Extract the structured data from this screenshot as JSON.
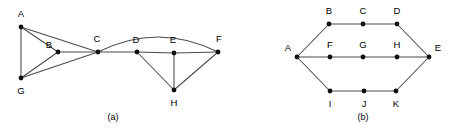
{
  "figure": {
    "background_color": "#ffffff",
    "edge_color": "#4a4a4a",
    "node_color": "#111111",
    "label_color": "#000000",
    "width": 449,
    "height": 133
  },
  "panels": [
    {
      "id": "panel-a",
      "caption": "(a)",
      "caption_pos": {
        "x": 113,
        "y": 118
      },
      "nodes": [
        {
          "id": "A",
          "label": "A",
          "x": 21,
          "y": 27,
          "lx": 21,
          "ly": 14
        },
        {
          "id": "B",
          "label": "B",
          "x": 58,
          "y": 52,
          "lx": 49,
          "ly": 45
        },
        {
          "id": "C",
          "label": "C",
          "x": 98,
          "y": 52,
          "lx": 97,
          "ly": 39
        },
        {
          "id": "D",
          "label": "D",
          "x": 137,
          "y": 52,
          "lx": 136,
          "ly": 40
        },
        {
          "id": "E",
          "label": "E",
          "x": 174,
          "y": 53,
          "lx": 173,
          "ly": 40
        },
        {
          "id": "F",
          "label": "F",
          "x": 218,
          "y": 52,
          "lx": 219,
          "ly": 39
        },
        {
          "id": "G",
          "label": "G",
          "x": 21,
          "y": 78,
          "lx": 21,
          "ly": 91
        },
        {
          "id": "H",
          "label": "H",
          "x": 174,
          "y": 90,
          "lx": 174,
          "ly": 103
        }
      ],
      "edges": [
        {
          "from": "A",
          "to": "G",
          "type": "line"
        },
        {
          "from": "A",
          "to": "B",
          "type": "line"
        },
        {
          "from": "A",
          "to": "C",
          "type": "line"
        },
        {
          "from": "B",
          "to": "C",
          "type": "line"
        },
        {
          "from": "B",
          "to": "G",
          "type": "line"
        },
        {
          "from": "G",
          "to": "C",
          "type": "line"
        },
        {
          "from": "C",
          "to": "D",
          "type": "line"
        },
        {
          "from": "D",
          "to": "E",
          "type": "line"
        },
        {
          "from": "E",
          "to": "F",
          "type": "line"
        },
        {
          "from": "D",
          "to": "H",
          "type": "line"
        },
        {
          "from": "E",
          "to": "H",
          "type": "line"
        },
        {
          "from": "F",
          "to": "H",
          "type": "line"
        },
        {
          "from": "C",
          "to": "F",
          "type": "curve",
          "cx": 158,
          "cy": 22
        }
      ]
    },
    {
      "id": "panel-b",
      "caption": "(b)",
      "caption_pos": {
        "x": 363,
        "y": 118
      },
      "nodes": [
        {
          "id": "A",
          "label": "A",
          "x": 297,
          "y": 57,
          "lx": 288,
          "ly": 48
        },
        {
          "id": "B",
          "label": "B",
          "x": 329,
          "y": 24,
          "lx": 329,
          "ly": 11
        },
        {
          "id": "C",
          "label": "C",
          "x": 363,
          "y": 24,
          "lx": 363,
          "ly": 11
        },
        {
          "id": "D",
          "label": "D",
          "x": 397,
          "y": 24,
          "lx": 397,
          "ly": 11
        },
        {
          "id": "E",
          "label": "E",
          "x": 429,
          "y": 57,
          "lx": 438,
          "ly": 48
        },
        {
          "id": "F",
          "label": "F",
          "x": 330,
          "y": 57,
          "lx": 330,
          "ly": 45
        },
        {
          "id": "G",
          "label": "G",
          "x": 363,
          "y": 57,
          "lx": 363,
          "ly": 45
        },
        {
          "id": "H",
          "label": "H",
          "x": 397,
          "y": 57,
          "lx": 397,
          "ly": 45
        },
        {
          "id": "I",
          "label": "I",
          "x": 330,
          "y": 91,
          "lx": 330,
          "ly": 104
        },
        {
          "id": "J",
          "label": "J",
          "x": 364,
          "y": 91,
          "lx": 364,
          "ly": 104
        },
        {
          "id": "K",
          "label": "K",
          "x": 396,
          "y": 91,
          "lx": 396,
          "ly": 104
        }
      ],
      "edges": [
        {
          "from": "A",
          "to": "B",
          "type": "line"
        },
        {
          "from": "B",
          "to": "C",
          "type": "line"
        },
        {
          "from": "C",
          "to": "D",
          "type": "line"
        },
        {
          "from": "D",
          "to": "E",
          "type": "line"
        },
        {
          "from": "A",
          "to": "F",
          "type": "line"
        },
        {
          "from": "F",
          "to": "G",
          "type": "line"
        },
        {
          "from": "G",
          "to": "H",
          "type": "line"
        },
        {
          "from": "H",
          "to": "E",
          "type": "line"
        },
        {
          "from": "A",
          "to": "I",
          "type": "line"
        },
        {
          "from": "I",
          "to": "J",
          "type": "line"
        },
        {
          "from": "J",
          "to": "K",
          "type": "line"
        },
        {
          "from": "K",
          "to": "E",
          "type": "line"
        }
      ]
    }
  ]
}
